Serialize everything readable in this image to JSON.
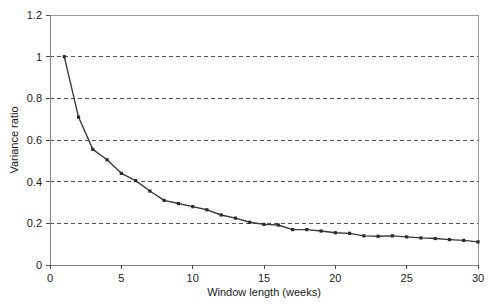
{
  "chart_data": {
    "type": "line",
    "title": "",
    "subtitle": "",
    "xlabel": "Window length (weeks)",
    "ylabel": "Variance ratio",
    "xlim": [
      0,
      30
    ],
    "ylim": [
      0,
      1.2
    ],
    "xticks": [
      0,
      5,
      10,
      15,
      20,
      25,
      30
    ],
    "xtick_labels": [
      "0",
      "5",
      "10",
      "15",
      "20",
      "25",
      "30"
    ],
    "yticks": [
      0,
      0.2,
      0.4,
      0.6,
      0.8,
      1,
      1.2
    ],
    "ytick_labels": [
      "0",
      "0.2",
      "0.4",
      "0.6",
      "0.8",
      "1",
      "1.2"
    ],
    "grid": true,
    "grid_axis": "y",
    "grid_values": [
      0.2,
      0.4,
      0.6,
      0.8,
      1
    ],
    "grid_style": "dashed",
    "legend": false,
    "legend_position": "none",
    "marker": "square",
    "line_color": "#3a3a3a",
    "marker_color": "#2b2b2b",
    "grid_color": "#555555",
    "axis_color": "#808080",
    "background_color": "#ffffff",
    "x": [
      1,
      2,
      3,
      4,
      5,
      6,
      7,
      8,
      9,
      10,
      11,
      12,
      13,
      14,
      15,
      16,
      17,
      18,
      19,
      20,
      21,
      22,
      23,
      24,
      25,
      26,
      27,
      28,
      29,
      30
    ],
    "series": [
      {
        "name": "Variance ratio",
        "values": [
          1.0,
          0.71,
          0.555,
          0.505,
          0.44,
          0.405,
          0.355,
          0.31,
          0.295,
          0.28,
          0.265,
          0.24,
          0.225,
          0.205,
          0.195,
          0.192,
          0.17,
          0.17,
          0.163,
          0.155,
          0.152,
          0.14,
          0.138,
          0.14,
          0.135,
          0.13,
          0.127,
          0.122,
          0.118,
          0.111
        ]
      }
    ]
  }
}
